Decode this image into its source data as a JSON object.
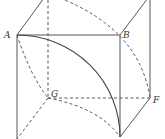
{
  "figure": {
    "type": "cube-with-quarter-arcs",
    "labels": {
      "A": "A",
      "B": "B",
      "G": "G",
      "F": "F"
    },
    "colors": {
      "line": "#555555",
      "background": "#ffffff"
    }
  }
}
